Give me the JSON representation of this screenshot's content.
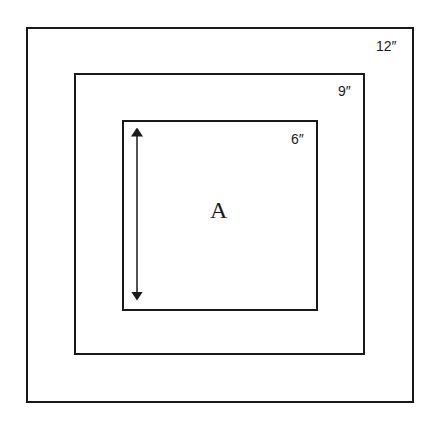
{
  "diagram": {
    "squares": [
      {
        "name": "outer",
        "label": "12″"
      },
      {
        "name": "middle",
        "label": "9″"
      },
      {
        "name": "inner",
        "label": "6″"
      }
    ],
    "center_label": "A",
    "arrow": "double-headed vertical arrow inside inner square"
  }
}
